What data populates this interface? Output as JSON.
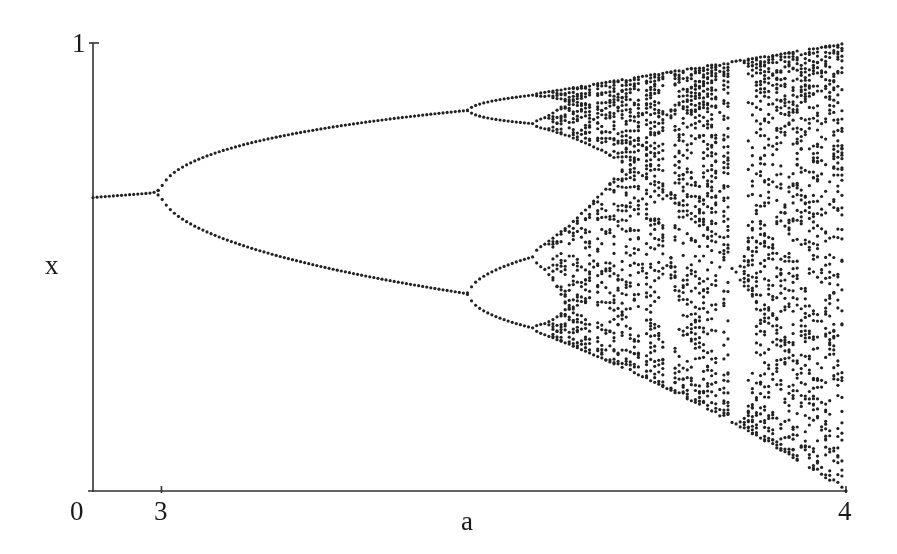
{
  "chart_data": {
    "type": "scatter",
    "title": "",
    "xlabel": "a",
    "ylabel": "x",
    "xlim": [
      2.9,
      4.0
    ],
    "ylim": [
      0,
      1
    ],
    "grid": false,
    "legend": null,
    "x_ticks": [
      {
        "value": 3,
        "label": "3"
      },
      {
        "value": 4,
        "label": "4"
      }
    ],
    "y_ticks": [
      {
        "value": 0,
        "label": "0"
      },
      {
        "value": 1,
        "label": "1"
      }
    ],
    "features": {
      "fixed_point_at_left": 0.655,
      "first_bifurcation_a": 3.0,
      "period4_bifurcation_a": 3.449,
      "period8_bifurcation_a": 3.544,
      "chaos_onset_a": 3.57,
      "period3_window_a": [
        3.828,
        3.857
      ],
      "max_x_at_a4": 1.0,
      "min_x_at_a4": 0.0
    },
    "sampling": {
      "columns": 185,
      "transient_iterations": 300,
      "plotted_iterations": 60,
      "dot_color": "#222222",
      "dot_radius": 1.6
    }
  },
  "axes": {
    "origin_label": "0",
    "y_top_label": "1",
    "x_tick_3": "3",
    "x_tick_4": "4",
    "x_axis_label": "a",
    "y_axis_label": "x"
  }
}
